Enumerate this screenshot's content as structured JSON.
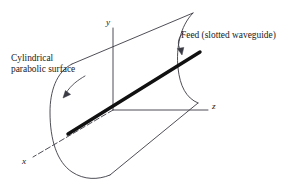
{
  "figure": {
    "type": "technical-line-diagram",
    "background_color": "#ffffff",
    "line_color": "#3a3a44",
    "feed_color": "#111111",
    "text_color": "#1a1a1a",
    "width": 298,
    "height": 185
  },
  "annotations": {
    "surface": {
      "line1": "Cylindrical",
      "line2": "parabolic surface",
      "leader": "curved-arrow-to-reflector-edge"
    },
    "feed": {
      "text": "Feed (slotted waveguide)",
      "leader": "curved-arrow-to-feed-line"
    }
  },
  "axes": {
    "y": {
      "label": "y",
      "direction": "up",
      "origin": [
        113,
        110
      ],
      "tip": [
        113,
        26
      ]
    },
    "z": {
      "label": "z",
      "direction": "right",
      "origin": [
        113,
        110
      ],
      "tip": [
        207,
        110
      ]
    },
    "x": {
      "label": "x",
      "direction": "down-left",
      "origin": [
        113,
        110
      ],
      "tip": [
        31,
        158
      ]
    }
  },
  "elements": {
    "feed_line": "thick-diagonal-waveguide",
    "near_parabola": "u-shaped-arc-left",
    "far_parabola": "u-shaped-arc-right",
    "top_rim": "straight-edge-upper",
    "bottom_rim": "straight-edge-lower"
  }
}
